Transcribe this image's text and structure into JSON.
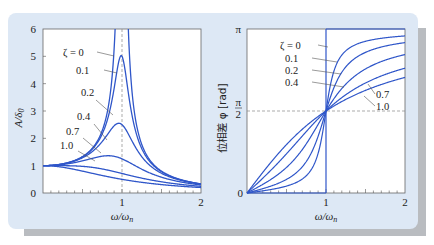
{
  "colors": {
    "curve": "#2f56c9",
    "panel_bg": "#dde8f5",
    "shadow": "#b9bcc0",
    "leader": "#555555",
    "guide": "#888888"
  },
  "chart_data": [
    {
      "type": "line",
      "title": "Amplitude ratio vs frequency ratio",
      "xlabel": "ω/ω_n",
      "ylabel": "A/δ₀",
      "xlim": [
        0,
        2
      ],
      "ylim": [
        0,
        6
      ],
      "xticks": [
        "1",
        "2"
      ],
      "yticks": [
        "0",
        "1",
        "2",
        "3",
        "4",
        "5",
        "6"
      ],
      "grid": false,
      "guide_line": {
        "x": 1,
        "style": "dashed"
      },
      "series": [
        {
          "name": "ζ = 0",
          "zeta": 0,
          "peak": "∞ at ω/ω_n = 1"
        },
        {
          "name": "0.1",
          "zeta": 0.1,
          "peak": 5.0
        },
        {
          "name": "0.2",
          "zeta": 0.2,
          "peak": 2.5
        },
        {
          "name": "0.4",
          "zeta": 0.4,
          "peak": 1.36
        },
        {
          "name": "0.7",
          "zeta": 0.7,
          "peak": 1.0
        },
        {
          "name": "1.0",
          "zeta": 1.0,
          "peak": 1.0
        }
      ],
      "formula": "A/δ0 = 1/sqrt((1-r^2)^2 + (2ζr)^2)"
    },
    {
      "type": "line",
      "title": "Phase difference vs frequency ratio",
      "xlabel": "ω/ω_n",
      "ylabel": "位相差 φ [rad]",
      "xlim": [
        0,
        2
      ],
      "ylim": [
        0,
        3.1416
      ],
      "xticks": [
        "1",
        "2"
      ],
      "yticks": [
        "0",
        "π/2",
        "π"
      ],
      "grid": false,
      "guide_line": {
        "y": "π/2",
        "style": "dashed"
      },
      "series": [
        {
          "name": "ζ = 0",
          "zeta": 0
        },
        {
          "name": "0.1",
          "zeta": 0.1
        },
        {
          "name": "0.2",
          "zeta": 0.2
        },
        {
          "name": "0.4",
          "zeta": 0.4
        },
        {
          "name": "0.7",
          "zeta": 0.7
        },
        {
          "name": "1.0",
          "zeta": 1.0
        }
      ],
      "formula": "φ = atan2(2ζr, 1-r^2)"
    }
  ],
  "left": {
    "ylabel": "A/δ",
    "ylabel_sub": "0",
    "xlabel": "ω/ω",
    "xlabel_sub": "n",
    "yticks": [
      "0",
      "1",
      "2",
      "3",
      "4",
      "5",
      "6"
    ],
    "xticks": [
      "0",
      "1",
      "2"
    ],
    "labels": [
      "ζ = 0",
      "0.1",
      "0.2",
      "0.4",
      "0.7",
      "1.0"
    ]
  },
  "right": {
    "ylabel": "位相差 φ [rad]",
    "xlabel": "ω/ω",
    "xlabel_sub": "n",
    "yticks": {
      "zero": "0",
      "pi": "π",
      "half_num": "π",
      "half_den": "2"
    },
    "xticks": [
      "1",
      "2"
    ],
    "labels": [
      "ζ = 0",
      "0.1",
      "0.2",
      "0.4",
      "0.7",
      "1.0"
    ]
  }
}
